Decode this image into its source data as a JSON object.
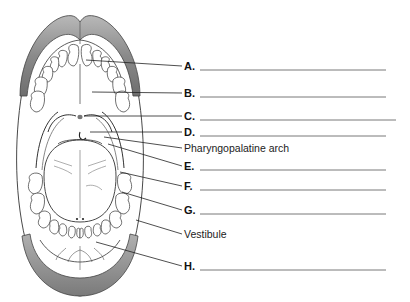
{
  "diagram": {
    "labels": [
      {
        "id": "A",
        "text": "A.",
        "blank": true,
        "y": 66
      },
      {
        "id": "B",
        "text": "B.",
        "blank": true,
        "y": 93
      },
      {
        "id": "C",
        "text": "C.",
        "blank": true,
        "y": 116
      },
      {
        "id": "D",
        "text": "D.",
        "blank": true,
        "y": 132
      },
      {
        "id": "pharyngopalatine",
        "text": "Pharyngopalatine arch",
        "blank": false,
        "y": 148
      },
      {
        "id": "E",
        "text": "E.",
        "blank": true,
        "y": 166
      },
      {
        "id": "F",
        "text": "F.",
        "blank": true,
        "y": 186
      },
      {
        "id": "G",
        "text": "G.",
        "blank": true,
        "y": 210
      },
      {
        "id": "vestibule",
        "text": "Vestibule",
        "blank": false,
        "y": 234
      },
      {
        "id": "H",
        "text": "H.",
        "blank": true,
        "y": 266
      }
    ]
  },
  "colors": {
    "lip": "#8a8a8a",
    "lip_highlight": "#b5b5b5",
    "outline": "#333333",
    "leader": "#222222",
    "blank_line": "#555555"
  }
}
